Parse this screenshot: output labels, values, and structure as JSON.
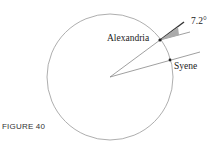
{
  "figure": {
    "caption": "FIGURE 40",
    "labels": {
      "alexandria": "Alexandria",
      "syene": "Syene",
      "angle": "7.2°"
    }
  }
}
